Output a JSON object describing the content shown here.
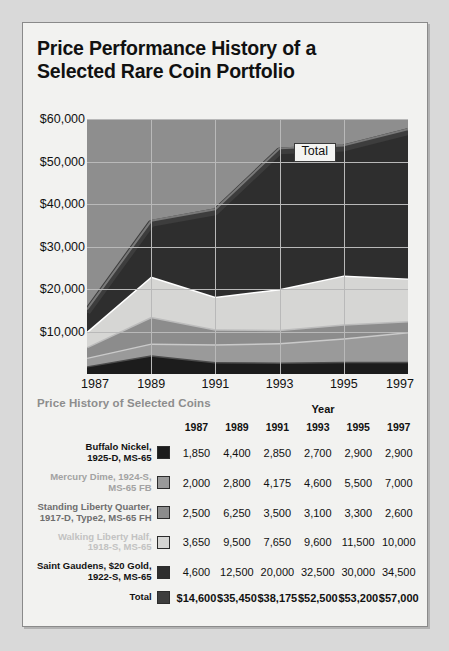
{
  "card": {
    "title_line1": "Price Performance History of a",
    "title_line2": "Selected Rare Coin Portfolio",
    "subtitle": "Price History of Selected Coins",
    "year_header": "Year"
  },
  "chart_data": {
    "type": "area",
    "title": "Price Performance History of a Selected Rare Coin Portfolio",
    "xlabel": "",
    "ylabel": "",
    "x": [
      1987,
      1989,
      1991,
      1993,
      1995,
      1997
    ],
    "tick_labels_x": [
      "1987",
      "1989",
      "1991",
      "1993",
      "1995",
      "1997"
    ],
    "tick_labels_y": [
      "$10,000",
      "$20,000",
      "$30,000",
      "$40,000",
      "$50,000",
      "$60,000"
    ],
    "ticks_y": [
      10000,
      20000,
      30000,
      40000,
      50000,
      60000
    ],
    "ylim": [
      0,
      60000
    ],
    "grid": true,
    "legend": "inline-annotation",
    "annotations": [
      {
        "text": "Total",
        "x": 1993,
        "y": 52500
      }
    ],
    "stacked": true,
    "series": [
      {
        "name": "Buffalo Nickel, 1925-D, MS-65",
        "color": "#1c1c1c",
        "values": [
          1850,
          4400,
          2850,
          2700,
          2900,
          2900
        ]
      },
      {
        "name": "Mercury Dime, 1924-S, MS-65 FB",
        "color": "#9a9a9a",
        "values": [
          2000,
          2800,
          4175,
          4600,
          5500,
          7000
        ]
      },
      {
        "name": "Standing Liberty Quarter, 1917-D, Type2, MS-65 FH",
        "color": "#8c8c8c",
        "values": [
          2500,
          6250,
          3500,
          3100,
          3300,
          2600
        ]
      },
      {
        "name": "Walking Liberty Half, 1918-S, MS-65",
        "color": "#d6d6d4",
        "values": [
          3650,
          9500,
          7650,
          9600,
          11500,
          10000
        ]
      },
      {
        "name": "Saint Gaudens, $20 Gold, 1922-S, MS-65",
        "color": "#2e2e2e",
        "values": [
          4600,
          12500,
          20000,
          32500,
          30000,
          34500
        ]
      }
    ],
    "total": {
      "name": "Total",
      "color": "#3d3d3d",
      "values": [
        14600,
        35450,
        38175,
        52500,
        53200,
        57000
      ]
    }
  },
  "table": {
    "columns": [
      "1987",
      "1989",
      "1991",
      "1993",
      "1995",
      "1997"
    ],
    "rows": [
      {
        "label_line1": "Buffalo Nickel,",
        "label_line2": "1925-D, MS-65",
        "label_color": "#111111",
        "swatch": "#1c1c1c",
        "values": [
          "1,850",
          "4,400",
          "2,850",
          "2,700",
          "2,900",
          "2,900"
        ]
      },
      {
        "label_line1": "Mercury Dime, 1924-S,",
        "label_line2": "MS-65 FB",
        "label_color": "#a2a2a2",
        "swatch": "#9a9a9a",
        "values": [
          "2,000",
          "2,800",
          "4,175",
          "4,600",
          "5,500",
          "7,000"
        ]
      },
      {
        "label_line1": "Standing Liberty Quarter,",
        "label_line2": "1917-D, Type2, MS-65 FH",
        "label_color": "#6e6e6e",
        "swatch": "#8c8c8c",
        "values": [
          "2,500",
          "6,250",
          "3,500",
          "3,100",
          "3,300",
          "2,600"
        ]
      },
      {
        "label_line1": "Walking Liberty Half,",
        "label_line2": "1918-S, MS-65",
        "label_color": "#c2c2c2",
        "swatch": "#d6d6d4",
        "values": [
          "3,650",
          "9,500",
          "7,650",
          "9,600",
          "11,500",
          "10,000"
        ]
      },
      {
        "label_line1": "Saint Gaudens, $20 Gold,",
        "label_line2": "1922-S, MS-65",
        "label_color": "#111111",
        "swatch": "#2e2e2e",
        "values": [
          "4,600",
          "12,500",
          "20,000",
          "32,500",
          "30,000",
          "34,500"
        ]
      },
      {
        "label_line1": "Total",
        "label_line2": "",
        "label_color": "#111111",
        "swatch": "#3d3d3d",
        "values": [
          "$14,600",
          "$35,450",
          "$38,175",
          "$52,500",
          "$53,200",
          "$57,000"
        ]
      }
    ]
  },
  "colors": {
    "plot_background": "#8e8e8e",
    "card_background": "#f2f2f0",
    "page_background": "#d9d9d9",
    "gridline": "#b9b9b9"
  }
}
